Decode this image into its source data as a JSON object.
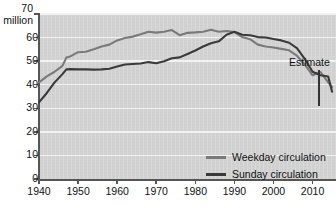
{
  "chart_data": {
    "type": "line",
    "title": "",
    "xlabel": "",
    "ylabel": "million",
    "y_unit_label": "million",
    "xlim": [
      1940,
      2016
    ],
    "ylim": [
      0,
      70
    ],
    "grid": true,
    "legend_position": "bottom-right",
    "yticks": [
      0,
      10,
      20,
      30,
      40,
      50,
      60,
      70
    ],
    "ytick_labels": [
      "0",
      "10",
      "20",
      "30",
      "40",
      "50",
      "60",
      "70"
    ],
    "xticks": [
      1940,
      1950,
      1960,
      1970,
      1980,
      1990,
      2000,
      2010
    ],
    "xtick_labels": [
      "1940",
      "1950",
      "1960",
      "1970",
      "1980",
      "1990",
      "2000",
      "2010"
    ],
    "annotations": [
      {
        "text": "Estimate",
        "x": 2014,
        "y": 48
      }
    ],
    "series": [
      {
        "name": "Weekday circulation",
        "color": "#7a7a7a",
        "x": [
          1940,
          1942,
          1944,
          1946,
          1947,
          1948,
          1950,
          1952,
          1954,
          1956,
          1958,
          1960,
          1962,
          1964,
          1966,
          1968,
          1970,
          1972,
          1974,
          1976,
          1978,
          1980,
          1982,
          1984,
          1986,
          1988,
          1990,
          1992,
          1994,
          1996,
          1998,
          2000,
          2002,
          2004,
          2006,
          2008,
          2010,
          2012,
          2014,
          2015
        ],
        "values": [
          41.0,
          43.5,
          45.5,
          48.0,
          51.5,
          52.0,
          53.8,
          54.0,
          55.0,
          56.2,
          57.0,
          58.8,
          59.8,
          60.4,
          61.4,
          62.5,
          62.1,
          62.5,
          63.2,
          61.0,
          62.0,
          62.2,
          62.5,
          63.3,
          62.5,
          62.8,
          62.3,
          60.2,
          59.3,
          57.0,
          56.2,
          55.8,
          55.2,
          54.6,
          52.3,
          48.6,
          44.0,
          45.4,
          41.0,
          39.0
        ]
      },
      {
        "name": "Sunday circulation",
        "color": "#3a3a3a",
        "x": [
          1940,
          1942,
          1944,
          1946,
          1947,
          1948,
          1950,
          1952,
          1954,
          1956,
          1958,
          1960,
          1962,
          1964,
          1966,
          1968,
          1970,
          1972,
          1974,
          1976,
          1978,
          1980,
          1982,
          1984,
          1986,
          1988,
          1990,
          1992,
          1994,
          1996,
          1998,
          2000,
          2002,
          2004,
          2006,
          2008,
          2010,
          2012,
          2014,
          2015
        ],
        "values": [
          32.5,
          36.5,
          41.0,
          44.5,
          46.5,
          46.6,
          46.5,
          46.5,
          46.4,
          46.5,
          46.8,
          47.7,
          48.6,
          48.8,
          49.0,
          49.6,
          49.1,
          50.0,
          51.2,
          51.6,
          53.0,
          54.5,
          56.2,
          57.6,
          58.4,
          61.2,
          62.5,
          61.2,
          61.0,
          60.2,
          60.0,
          59.4,
          58.8,
          57.8,
          55.5,
          51.0,
          45.5,
          44.0,
          43.5,
          37.0
        ]
      }
    ]
  },
  "axis": {
    "y_top_value": "70",
    "y_unit": "million"
  },
  "legend": {
    "items": [
      {
        "label": "Weekday circulation",
        "color": "#7a7a7a"
      },
      {
        "label": "Sunday circulation",
        "color": "#3a3a3a"
      }
    ]
  },
  "annotation": {
    "estimate": "Estimate"
  }
}
